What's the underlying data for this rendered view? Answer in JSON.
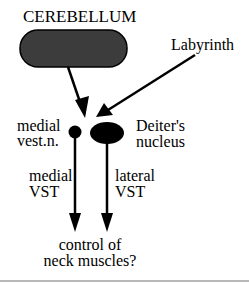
{
  "diagram": {
    "nodes": {
      "cerebellum": {
        "label": "CEREBELLUM",
        "fill": "#3c3c3c"
      },
      "labyrinth": {
        "label": "Labyrinth"
      },
      "medial_vest_n": {
        "label_line1": "medial",
        "label_line2": "vest.n."
      },
      "deiters_nucleus": {
        "label_line1": "Deiter's",
        "label_line2": "nucleus"
      },
      "output": {
        "label_line1": "control of",
        "label_line2": "neck muscles?"
      }
    },
    "edges": {
      "medial_vst": {
        "label_line1": "medial",
        "label_line2": "VST"
      },
      "lateral_vst": {
        "label_line1": "lateral",
        "label_line2": "VST"
      }
    },
    "colors": {
      "ink": "#000000",
      "rule": "#b8b8b8"
    }
  }
}
